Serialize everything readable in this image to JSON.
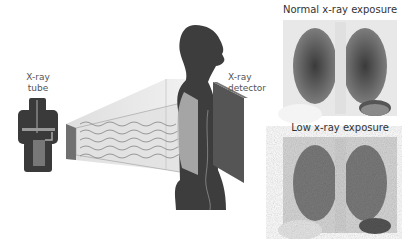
{
  "labels": {
    "tube_line1": "X-ray",
    "tube_line2": "tube",
    "detector_line1": "X-ray",
    "detector_line2": "detector",
    "normal_title": "Normal x-ray exposure",
    "low_title": "Low x-ray exposure"
  }
}
